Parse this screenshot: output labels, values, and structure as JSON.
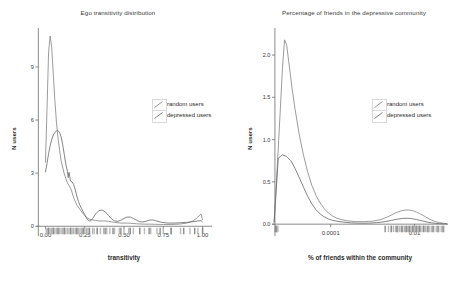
{
  "figure": {
    "background": "#ffffff",
    "series_colors": {
      "random_users": "#8a8a8a",
      "depressed_users": "#6e6e6e"
    },
    "panels": [
      "left",
      "right"
    ]
  },
  "legend": {
    "items": [
      {
        "label": "random users",
        "key_icon": "diagonal-line-icon",
        "color": "#8a8a8a"
      },
      {
        "label": "depressed users",
        "key_icon": "diagonal-line-icon",
        "color": "#6e6e6e"
      }
    ]
  },
  "chart_data": [
    {
      "type": "line",
      "panel": "left",
      "title": "Ego transitivity distribution",
      "xlabel": "transitivity",
      "ylabel": "N users",
      "grid": false,
      "legend_position": "right-upper",
      "xlim": [
        -0.06,
        1.06
      ],
      "ylim": [
        -0.55,
        11.2
      ],
      "xticks": [
        0.0,
        0.25,
        0.5,
        0.75,
        1.0
      ],
      "xticklabels": [
        "0.00",
        "0.25",
        "0.50",
        "0.75",
        "1.00"
      ],
      "yticks": [
        0,
        3,
        6,
        9
      ],
      "yticklabels": [
        "0",
        "3",
        "6",
        "9"
      ],
      "rug": true,
      "series": [
        {
          "name": "random users",
          "color": "#8a8a8a",
          "x": [
            0.0,
            0.01,
            0.02,
            0.03,
            0.04,
            0.05,
            0.06,
            0.07,
            0.08,
            0.09,
            0.1,
            0.12,
            0.14,
            0.15,
            0.16,
            0.17,
            0.18,
            0.2,
            0.22,
            0.24,
            0.26,
            0.28,
            0.3,
            0.32,
            0.34,
            0.36,
            0.38,
            0.4,
            0.44,
            0.48,
            0.52,
            0.54,
            0.58,
            0.62,
            0.66,
            0.7,
            0.75,
            0.8,
            0.85,
            0.9,
            0.94,
            0.97,
            0.99,
            1.0
          ],
          "y": [
            3.6,
            6.6,
            9.8,
            10.75,
            10.1,
            8.6,
            7.1,
            5.9,
            5.0,
            4.3,
            3.7,
            2.95,
            2.45,
            2.3,
            2.15,
            1.9,
            1.6,
            1.2,
            0.95,
            0.7,
            0.52,
            0.4,
            0.36,
            0.33,
            0.3,
            0.3,
            0.3,
            0.28,
            0.22,
            0.18,
            0.18,
            0.17,
            0.14,
            0.12,
            0.12,
            0.11,
            0.1,
            0.1,
            0.12,
            0.18,
            0.3,
            0.52,
            0.7,
            0.35
          ]
        },
        {
          "name": "depressed users",
          "color": "#6e6e6e",
          "x": [
            0.0,
            0.01,
            0.02,
            0.03,
            0.04,
            0.05,
            0.06,
            0.07,
            0.08,
            0.09,
            0.1,
            0.11,
            0.12,
            0.13,
            0.14,
            0.145,
            0.15,
            0.155,
            0.16,
            0.17,
            0.18,
            0.19,
            0.2,
            0.21,
            0.22,
            0.23,
            0.24,
            0.25,
            0.26,
            0.27,
            0.28,
            0.29,
            0.3,
            0.32,
            0.34,
            0.36,
            0.38,
            0.4,
            0.42,
            0.44,
            0.46,
            0.48,
            0.5,
            0.52,
            0.54,
            0.56,
            0.58,
            0.6,
            0.62,
            0.64,
            0.66,
            0.68,
            0.7,
            0.74,
            0.78,
            0.82,
            0.86,
            0.9,
            0.94,
            0.97,
            0.99,
            1.0
          ],
          "y": [
            3.05,
            3.55,
            4.1,
            4.55,
            4.9,
            5.15,
            5.3,
            5.38,
            5.4,
            5.3,
            5.05,
            4.6,
            4.05,
            3.5,
            3.1,
            2.75,
            3.05,
            2.8,
            2.55,
            2.5,
            2.35,
            2.05,
            1.7,
            1.4,
            1.18,
            1.0,
            0.82,
            0.65,
            0.48,
            0.36,
            0.3,
            0.32,
            0.44,
            0.7,
            0.88,
            0.92,
            0.82,
            0.62,
            0.42,
            0.3,
            0.28,
            0.34,
            0.44,
            0.52,
            0.52,
            0.44,
            0.34,
            0.26,
            0.24,
            0.28,
            0.34,
            0.36,
            0.32,
            0.22,
            0.18,
            0.18,
            0.2,
            0.22,
            0.26,
            0.3,
            0.32,
            0.25
          ]
        }
      ],
      "rug_ticks_random": [
        0.005,
        0.012,
        0.02,
        0.03,
        0.04,
        0.05,
        0.06,
        0.07,
        0.08,
        0.09,
        0.1,
        0.11,
        0.12,
        0.13,
        0.14,
        0.15,
        0.16,
        0.17,
        0.18,
        0.19,
        0.2,
        0.21,
        0.22,
        0.23,
        0.24,
        0.25,
        0.26,
        0.27,
        0.28,
        0.3,
        0.31,
        0.33,
        0.35,
        0.37,
        0.39,
        0.41,
        0.44,
        0.47,
        0.5,
        0.53,
        0.56,
        0.6,
        0.63,
        0.67,
        0.71,
        0.75,
        0.8,
        0.86,
        0.92,
        0.97,
        1.0
      ],
      "rug_ticks_depressed": [
        0.02,
        0.05,
        0.08,
        0.12,
        0.16,
        0.2,
        0.24,
        0.28,
        0.33,
        0.38,
        0.43,
        0.48,
        0.54,
        0.6,
        0.66,
        0.73,
        0.8,
        0.88,
        0.95,
        1.0
      ]
    },
    {
      "type": "line",
      "panel": "right",
      "title": "Percentage of friends in the depressive community",
      "xlabel": "% of friends within the community",
      "ylabel": "N users",
      "grid": false,
      "legend_position": "right-upper",
      "xscale": "log",
      "xlim_log10": [
        -5.4,
        -1.2
      ],
      "ylim": [
        -0.14,
        2.32
      ],
      "xticks_log10": [
        -4,
        -2
      ],
      "xticklabels": [
        "0.0001",
        "0.01"
      ],
      "yticks": [
        0.0,
        0.5,
        1.0,
        1.5,
        2.0
      ],
      "yticklabels": [
        "0.0",
        "0.5",
        "1.0",
        "1.5",
        "2.0"
      ],
      "rug": true,
      "series": [
        {
          "name": "random users",
          "color": "#8a8a8a",
          "x_log10": [
            -5.35,
            -5.25,
            -5.15,
            -5.1,
            -5.05,
            -5.0,
            -4.92,
            -4.85,
            -4.75,
            -4.65,
            -4.55,
            -4.45,
            -4.35,
            -4.25,
            -4.15,
            -4.05,
            -3.95,
            -3.85,
            -3.75,
            -3.6,
            -3.4,
            -3.2,
            -3.0,
            -2.8,
            -2.6,
            -2.45,
            -2.3,
            -2.2,
            -2.12,
            -2.05,
            -2.0,
            -1.95,
            -1.88,
            -1.8,
            -1.7,
            -1.6,
            -1.5,
            -1.4,
            -1.3,
            -1.22
          ],
          "y": [
            0.02,
            0.9,
            1.85,
            2.18,
            2.12,
            1.92,
            1.6,
            1.36,
            1.06,
            0.82,
            0.62,
            0.46,
            0.34,
            0.25,
            0.18,
            0.13,
            0.095,
            0.07,
            0.055,
            0.04,
            0.03,
            0.03,
            0.035,
            0.055,
            0.095,
            0.135,
            0.16,
            0.168,
            0.167,
            0.16,
            0.152,
            0.142,
            0.125,
            0.105,
            0.075,
            0.05,
            0.03,
            0.018,
            0.01,
            0.006
          ]
        },
        {
          "name": "depressed users",
          "color": "#6e6e6e",
          "x_log10": [
            -5.35,
            -5.25,
            -5.15,
            -5.05,
            -4.95,
            -4.85,
            -4.75,
            -4.65,
            -4.55,
            -4.45,
            -4.35,
            -4.25,
            -4.15,
            -4.05,
            -3.95,
            -3.85,
            -3.7,
            -3.5,
            -3.3,
            -3.1,
            -2.9,
            -2.7,
            -2.55,
            -2.4,
            -2.28,
            -2.18,
            -2.1,
            -2.05,
            -2.0,
            -1.95,
            -1.88,
            -1.8,
            -1.7,
            -1.6,
            -1.5,
            -1.4,
            -1.3,
            -1.22
          ],
          "y": [
            0.02,
            0.78,
            0.82,
            0.8,
            0.75,
            0.66,
            0.55,
            0.44,
            0.33,
            0.24,
            0.17,
            0.12,
            0.085,
            0.06,
            0.045,
            0.035,
            0.025,
            0.015,
            0.012,
            0.012,
            0.018,
            0.03,
            0.045,
            0.06,
            0.068,
            0.07,
            0.068,
            0.064,
            0.06,
            0.054,
            0.046,
            0.037,
            0.025,
            0.016,
            0.01,
            0.006,
            0.004,
            0.003
          ]
        }
      ],
      "rug_ticks_random_log10": [
        -5.3,
        -5.28,
        -5.26,
        -2.62,
        -2.56,
        -2.5,
        -2.45,
        -2.4,
        -2.36,
        -2.32,
        -2.28,
        -2.24,
        -2.2,
        -2.17,
        -2.14,
        -2.11,
        -2.08,
        -2.05,
        -2.02,
        -1.99,
        -1.96,
        -1.93,
        -1.9,
        -1.86,
        -1.82,
        -1.78,
        -1.74,
        -1.7,
        -1.65,
        -1.6,
        -1.54,
        -1.48,
        -1.42,
        -1.36,
        -1.3
      ],
      "rug_ticks_depressed_log10": [
        -5.32,
        -5.3,
        -2.7,
        -2.55,
        -2.42,
        -2.3,
        -2.2,
        -2.12,
        -2.04,
        -1.96,
        -1.88,
        -1.78,
        -1.68,
        -1.56,
        -1.44,
        -1.32
      ]
    }
  ]
}
